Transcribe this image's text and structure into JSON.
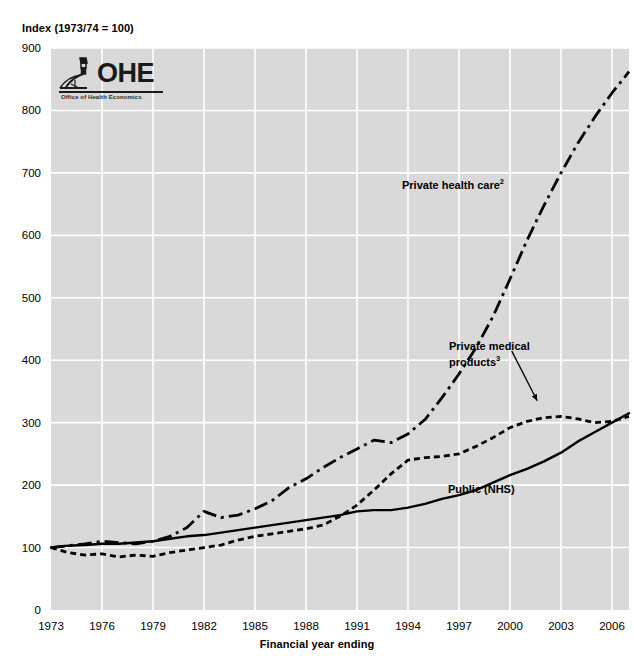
{
  "chart_data": {
    "type": "line",
    "title": "",
    "ylabel": "Index (1973/74 = 100)",
    "xlabel": "Financial year ending",
    "ylim": [
      0,
      900
    ],
    "xlim": [
      1973,
      2007
    ],
    "grid": true,
    "legend": "inline-annotations",
    "yticks": [
      "0",
      "100",
      "200",
      "300",
      "400",
      "500",
      "600",
      "700",
      "800",
      "900"
    ],
    "xticks": [
      "1973",
      "1976",
      "1979",
      "1982",
      "1985",
      "1988",
      "1991",
      "1994",
      "1997",
      "2000",
      "2003",
      "2006"
    ],
    "x": [
      1973,
      1974,
      1975,
      1976,
      1977,
      1978,
      1979,
      1980,
      1981,
      1982,
      1983,
      1984,
      1985,
      1986,
      1987,
      1988,
      1989,
      1990,
      1991,
      1992,
      1993,
      1994,
      1995,
      1996,
      1997,
      1998,
      1999,
      2000,
      2001,
      2002,
      2003,
      2004,
      2005,
      2006,
      2007
    ],
    "series": [
      {
        "name": "Private health care",
        "footnote": "2",
        "style": "dash-dot",
        "label_text": "Private health care",
        "values": [
          100,
          103,
          106,
          110,
          108,
          106,
          110,
          118,
          132,
          158,
          148,
          152,
          162,
          175,
          196,
          210,
          228,
          244,
          258,
          272,
          268,
          282,
          305,
          340,
          378,
          420,
          470,
          530,
          592,
          648,
          700,
          748,
          790,
          828,
          862
        ]
      },
      {
        "name": "Private medical products",
        "footnote": "3",
        "style": "dotted",
        "label_text": "Private medical products",
        "values": [
          100,
          92,
          88,
          90,
          85,
          88,
          86,
          92,
          96,
          100,
          104,
          112,
          118,
          122,
          126,
          130,
          136,
          150,
          168,
          192,
          218,
          240,
          244,
          246,
          250,
          262,
          276,
          292,
          302,
          308,
          310,
          306,
          300,
          302,
          310
        ]
      },
      {
        "name": "Public (NHS)",
        "footnote": "",
        "style": "solid",
        "label_text": "Public (NHS)",
        "values": [
          100,
          103,
          104,
          106,
          106,
          108,
          110,
          114,
          118,
          120,
          124,
          128,
          132,
          136,
          140,
          144,
          148,
          152,
          158,
          160,
          160,
          164,
          170,
          178,
          184,
          192,
          204,
          216,
          226,
          238,
          252,
          270,
          285,
          300,
          315
        ]
      }
    ],
    "annotations": [
      {
        "id": "arrow-private-medical-products",
        "from_x": 2000.1,
        "from_y": 415,
        "to_x": 2001.6,
        "to_y": 335
      }
    ]
  },
  "logo": {
    "name": "OHE",
    "wordmark": "OHE",
    "subtitle": "Office of Health Economics",
    "icon": "microscope-icon"
  },
  "colors": {
    "plot_background": "#d9d9d9",
    "gridline": "#ffffff",
    "series_line": "#000000",
    "page_background": "#ffffff",
    "text": "#000000"
  }
}
